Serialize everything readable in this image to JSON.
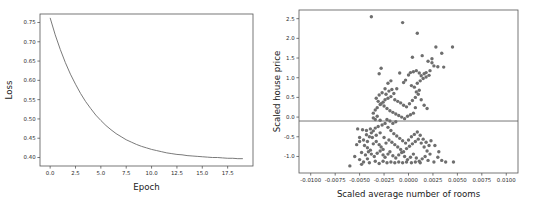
{
  "figure": {
    "background": "#ffffff",
    "panel_count": 2
  },
  "chart_data": [
    {
      "type": "line",
      "panel": "left",
      "title": "",
      "xlabel": "Epoch",
      "ylabel": "Loss",
      "xlim": [
        -1.0,
        20.0
      ],
      "ylim": [
        0.378,
        0.772
      ],
      "xticks": [
        "0.0",
        "2.5",
        "5.0",
        "7.5",
        "10.0",
        "12.5",
        "15.0",
        "17.5"
      ],
      "xtickvalues": [
        0.0,
        2.5,
        5.0,
        7.5,
        10.0,
        12.5,
        15.0,
        17.5
      ],
      "yticks": [
        "0.40",
        "0.45",
        "0.50",
        "0.55",
        "0.60",
        "0.65",
        "0.70",
        "0.75"
      ],
      "ytickvalues": [
        0.4,
        0.45,
        0.5,
        0.55,
        0.6,
        0.65,
        0.7,
        0.75
      ],
      "grid": false,
      "legend": null,
      "line_color": "#6b6b6b",
      "x": [
        0,
        0.5,
        1,
        1.5,
        2,
        2.5,
        3,
        3.5,
        4,
        4.5,
        5,
        5.5,
        6,
        6.5,
        7,
        7.5,
        8,
        8.5,
        9,
        9.5,
        10,
        10.5,
        11,
        11.5,
        12,
        12.5,
        13,
        13.5,
        14,
        14.5,
        15,
        15.5,
        16,
        16.5,
        17,
        17.5,
        18,
        18.5,
        19
      ],
      "y": [
        0.762,
        0.718,
        0.68,
        0.646,
        0.616,
        0.59,
        0.566,
        0.545,
        0.527,
        0.51,
        0.496,
        0.483,
        0.472,
        0.462,
        0.454,
        0.446,
        0.44,
        0.434,
        0.429,
        0.425,
        0.421,
        0.418,
        0.415,
        0.412,
        0.41,
        0.408,
        0.407,
        0.405,
        0.404,
        0.403,
        0.402,
        0.401,
        0.4,
        0.4,
        0.399,
        0.398,
        0.398,
        0.397,
        0.397
      ]
    },
    {
      "type": "scatter",
      "panel": "right",
      "title": "",
      "xlabel": "Scaled average number of rooms",
      "ylabel": "Scaled house price",
      "xlim": [
        -0.0112,
        0.0112
      ],
      "ylim": [
        -1.42,
        2.72
      ],
      "xticks": [
        "-0.0100",
        "-0.0075",
        "-0.0050",
        "-0.0025",
        "0.0000",
        "0.0025",
        "0.0050",
        "0.0075",
        "0.0100"
      ],
      "xtickvalues": [
        -0.01,
        -0.0075,
        -0.005,
        -0.0025,
        0.0,
        0.0025,
        0.005,
        0.0075,
        0.01
      ],
      "yticks": [
        "2.5",
        "2.0",
        "1.5",
        "1.0",
        "0.5",
        "0.0",
        "-0.5",
        "-1.0"
      ],
      "ytickvalues": [
        2.5,
        2.0,
        1.5,
        1.0,
        0.5,
        0.0,
        -0.5,
        -1.0
      ],
      "grid": false,
      "legend": null,
      "point_color": "#6e6e6e",
      "point_size": 3.4,
      "hline_y": -0.1,
      "hline_color": "#555555",
      "points": [
        [
          -0.0038,
          2.55
        ],
        [
          -0.0006,
          2.4
        ],
        [
          0.0009,
          2.13
        ],
        [
          -0.003,
          1.1
        ],
        [
          -0.0028,
          1.24
        ],
        [
          -0.0009,
          1.12
        ],
        [
          0.0004,
          1.52
        ],
        [
          0.0014,
          1.56
        ],
        [
          0.0028,
          1.78
        ],
        [
          0.0034,
          1.62
        ],
        [
          0.0045,
          1.78
        ],
        [
          0.002,
          1.42
        ],
        [
          0.0024,
          1.38
        ],
        [
          0.0026,
          1.3
        ],
        [
          0.003,
          1.28
        ],
        [
          0.0036,
          1.27
        ],
        [
          0.0022,
          1.18
        ],
        [
          0.0018,
          1.13
        ],
        [
          0.0016,
          1.1
        ],
        [
          0.0013,
          1.05
        ],
        [
          0.0011,
          1.12
        ],
        [
          0.0008,
          1.18
        ],
        [
          0.0005,
          1.15
        ],
        [
          0.0002,
          1.13
        ],
        [
          0.0,
          1.07
        ],
        [
          -0.0003,
          0.94
        ],
        [
          -0.0005,
          0.88
        ],
        [
          0.0003,
          0.8
        ],
        [
          0.0006,
          0.76
        ],
        [
          0.0009,
          0.86
        ],
        [
          0.0012,
          0.92
        ],
        [
          0.0015,
          0.98
        ],
        [
          0.0018,
          1.02
        ],
        [
          0.0021,
          1.06
        ],
        [
          -0.0012,
          0.72
        ],
        [
          -0.0015,
          0.6
        ],
        [
          -0.0018,
          0.52
        ],
        [
          -0.0021,
          0.48
        ],
        [
          -0.0024,
          0.44
        ],
        [
          -0.0026,
          0.38
        ],
        [
          -0.0029,
          0.32
        ],
        [
          -0.0032,
          0.24
        ],
        [
          -0.0034,
          0.18
        ],
        [
          -0.0036,
          0.1
        ],
        [
          -0.003,
          0.56
        ],
        [
          -0.0027,
          0.62
        ],
        [
          -0.0023,
          0.58
        ],
        [
          -0.002,
          0.66
        ],
        [
          -0.0017,
          0.7
        ],
        [
          -0.0014,
          0.44
        ],
        [
          -0.0011,
          0.4
        ],
        [
          -0.0008,
          0.36
        ],
        [
          -0.0005,
          0.3
        ],
        [
          -0.0002,
          0.26
        ],
        [
          0.0001,
          0.34
        ],
        [
          0.0004,
          0.42
        ],
        [
          0.0007,
          0.5
        ],
        [
          0.001,
          0.58
        ],
        [
          -0.0033,
          0.48
        ],
        [
          -0.0031,
          0.4
        ],
        [
          -0.0028,
          0.34
        ],
        [
          -0.0025,
          0.28
        ],
        [
          -0.0022,
          0.22
        ],
        [
          -0.0019,
          0.16
        ],
        [
          -0.0016,
          0.12
        ],
        [
          -0.0013,
          0.08
        ],
        [
          -0.001,
          0.04
        ],
        [
          -0.0007,
          0.0
        ],
        [
          -0.0004,
          -0.04
        ],
        [
          -0.0001,
          0.02
        ],
        [
          0.0002,
          0.06
        ],
        [
          0.0005,
          0.1
        ],
        [
          0.0008,
          0.64
        ],
        [
          0.0011,
          0.68
        ],
        [
          -0.0036,
          -0.02
        ],
        [
          -0.0034,
          -0.06
        ],
        [
          -0.0032,
          0.02
        ],
        [
          -0.0029,
          -0.08
        ],
        [
          -0.0052,
          -0.3
        ],
        [
          -0.0047,
          -0.32
        ],
        [
          -0.0043,
          -0.45
        ],
        [
          -0.005,
          -0.52
        ],
        [
          -0.0046,
          -0.58
        ],
        [
          -0.0042,
          -0.62
        ],
        [
          -0.004,
          -0.5
        ],
        [
          -0.0038,
          -0.4
        ],
        [
          -0.0036,
          -0.35
        ],
        [
          -0.0034,
          -0.28
        ],
        [
          -0.0031,
          -0.24
        ],
        [
          -0.0027,
          -0.2
        ],
        [
          -0.0024,
          -0.16
        ],
        [
          -0.0021,
          -0.26
        ],
        [
          -0.0018,
          -0.34
        ],
        [
          -0.0015,
          -0.42
        ],
        [
          -0.0012,
          -0.48
        ],
        [
          -0.0009,
          -0.54
        ],
        [
          -0.0006,
          -0.6
        ],
        [
          -0.0003,
          -0.66
        ],
        [
          0.0,
          -0.58
        ],
        [
          0.0003,
          -0.5
        ],
        [
          0.0006,
          -0.44
        ],
        [
          0.0009,
          -0.38
        ],
        [
          0.0012,
          -0.46
        ],
        [
          0.0015,
          -0.56
        ],
        [
          0.0018,
          -0.64
        ],
        [
          0.0021,
          -0.72
        ],
        [
          -0.0045,
          -0.72
        ],
        [
          -0.0042,
          -0.78
        ],
        [
          -0.0039,
          -0.84
        ],
        [
          -0.0036,
          -0.68
        ],
        [
          -0.0033,
          -0.62
        ],
        [
          -0.003,
          -0.7
        ],
        [
          -0.0028,
          -0.76
        ],
        [
          -0.0026,
          -0.82
        ],
        [
          -0.0023,
          -0.66
        ],
        [
          -0.002,
          -0.58
        ],
        [
          -0.0017,
          -0.64
        ],
        [
          -0.0014,
          -0.7
        ],
        [
          -0.0011,
          -0.76
        ],
        [
          -0.0008,
          -0.82
        ],
        [
          -0.0005,
          -0.88
        ],
        [
          -0.0002,
          -0.8
        ],
        [
          0.0001,
          -0.74
        ],
        [
          0.0004,
          -0.68
        ],
        [
          0.0007,
          -0.62
        ],
        [
          0.001,
          -0.56
        ],
        [
          0.0013,
          -0.66
        ],
        [
          0.0016,
          -0.76
        ],
        [
          0.0019,
          -0.86
        ],
        [
          0.0022,
          -0.94
        ],
        [
          -0.0048,
          -0.9
        ],
        [
          -0.0044,
          -0.96
        ],
        [
          -0.0041,
          -0.88
        ],
        [
          -0.0038,
          -0.94
        ],
        [
          -0.0035,
          -1.0
        ],
        [
          -0.0032,
          -0.92
        ],
        [
          -0.0029,
          -0.86
        ],
        [
          -0.0026,
          -0.96
        ],
        [
          -0.0024,
          -1.02
        ],
        [
          -0.0021,
          -0.94
        ],
        [
          -0.0019,
          -0.88
        ],
        [
          -0.0016,
          -0.98
        ],
        [
          -0.0013,
          -1.04
        ],
        [
          -0.001,
          -0.96
        ],
        [
          -0.0007,
          -0.9
        ],
        [
          -0.0004,
          -1.0
        ],
        [
          -0.0001,
          -1.08
        ],
        [
          0.0002,
          -1.02
        ],
        [
          0.0005,
          -0.94
        ],
        [
          0.0008,
          -1.04
        ],
        [
          0.0011,
          -1.12
        ],
        [
          0.0014,
          -1.06
        ],
        [
          0.0017,
          -1.0
        ],
        [
          0.002,
          -1.1
        ],
        [
          -0.0055,
          -1.0
        ],
        [
          -0.005,
          -1.08
        ],
        [
          -0.0046,
          -1.14
        ],
        [
          -0.0042,
          -1.06
        ],
        [
          -0.006,
          -1.24
        ],
        [
          -0.0048,
          -1.2
        ],
        [
          -0.004,
          -1.16
        ],
        [
          -0.0034,
          -1.12
        ],
        [
          -0.003,
          -1.18
        ],
        [
          -0.0026,
          -1.12
        ],
        [
          -0.0022,
          -1.16
        ],
        [
          -0.0018,
          -1.14
        ],
        [
          -0.0014,
          -1.16
        ],
        [
          -0.001,
          -1.14
        ],
        [
          -0.0006,
          -1.16
        ],
        [
          -0.0002,
          -1.14
        ],
        [
          0.0003,
          -1.16
        ],
        [
          0.0007,
          -1.14
        ],
        [
          0.0012,
          -1.16
        ],
        [
          0.0026,
          -1.14
        ],
        [
          0.003,
          -1.02
        ],
        [
          0.0034,
          -1.1
        ],
        [
          0.0023,
          -0.6
        ],
        [
          0.0027,
          -0.72
        ],
        [
          0.0031,
          -0.88
        ],
        [
          0.0038,
          -1.14
        ],
        [
          0.0046,
          -1.14
        ],
        [
          -0.0043,
          -0.34
        ],
        [
          -0.0039,
          -0.3
        ],
        [
          -0.005,
          -0.62
        ],
        [
          -0.0053,
          -0.7
        ],
        [
          -0.0037,
          -0.52
        ],
        [
          -0.0033,
          -0.46
        ],
        [
          -0.0029,
          -0.4
        ],
        [
          -0.0025,
          -0.52
        ],
        [
          -0.0016,
          -0.16
        ],
        [
          -0.0013,
          -0.12
        ],
        [
          -0.0019,
          -0.1
        ],
        [
          -0.0022,
          -0.06
        ],
        [
          0.0013,
          0.44
        ],
        [
          0.0016,
          0.3
        ],
        [
          0.0019,
          0.22
        ],
        [
          0.0007,
          0.24
        ],
        [
          -0.0024,
          0.72
        ],
        [
          -0.0021,
          0.86
        ],
        [
          -0.0018,
          0.92
        ],
        [
          0.0024,
          1.48
        ]
      ]
    }
  ]
}
